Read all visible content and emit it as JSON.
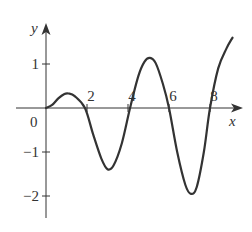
{
  "chart_data": {
    "type": "line",
    "title": "",
    "xlabel": "x",
    "ylabel": "y",
    "origin_label": "0",
    "xticks": [
      2,
      4,
      6,
      8
    ],
    "xtick_labels": [
      "2",
      "4",
      "6",
      "8"
    ],
    "yticks": [
      1,
      -1,
      -2
    ],
    "ytick_labels": [
      "1",
      "−1",
      "−2"
    ],
    "xlim": [
      -2.0,
      9.4
    ],
    "ylim": [
      -2.5,
      1.9
    ],
    "grid": false,
    "legend": null,
    "series": [
      {
        "name": "curve",
        "color": "#333333",
        "x": [
          0,
          0.3,
          0.6,
          0.9,
          1.1,
          1.4,
          1.9,
          2.3,
          2.7,
          3.0,
          3.3,
          3.7,
          4.1,
          4.5,
          4.8,
          5.07,
          5.35,
          5.7,
          6.0,
          6.4,
          6.8,
          7.07,
          7.35,
          7.7,
          8.0,
          8.4,
          8.8,
          9.1
        ],
        "y": [
          0,
          0.07,
          0.22,
          0.32,
          0.33,
          0.27,
          0.0,
          -0.6,
          -1.15,
          -1.39,
          -1.3,
          -0.8,
          0.0,
          0.72,
          1.05,
          1.14,
          1.02,
          0.55,
          0.0,
          -1.0,
          -1.75,
          -1.95,
          -1.8,
          -1.0,
          0.0,
          0.9,
          1.35,
          1.6
        ]
      }
    ]
  }
}
